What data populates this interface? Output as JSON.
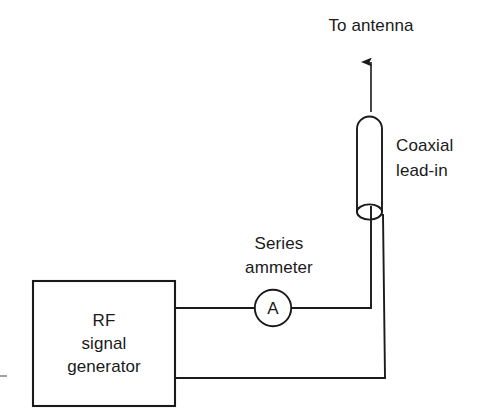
{
  "diagram": {
    "background_color": "#ffffff",
    "line_color": "#1a1a1a",
    "text_color": "#1a1a1a",
    "labels": {
      "to_antenna": "To antenna",
      "coaxial_line1": "Coaxial",
      "coaxial_line2": "lead-in",
      "series_line1": "Series",
      "series_line2": "ammeter",
      "ammeter_symbol": "A",
      "generator_line1": "RF",
      "generator_line2": "signal",
      "generator_line3": "generator"
    }
  }
}
